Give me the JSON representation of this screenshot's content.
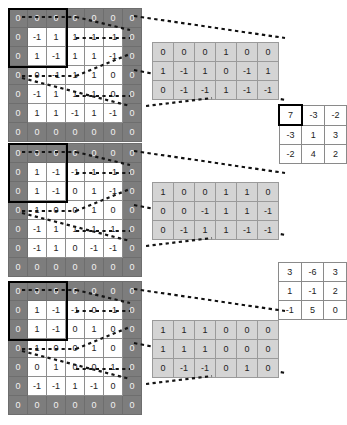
{
  "figure": {
    "colors": {
      "padding_cell": "#7d7d7d",
      "value_cell": "#ffffff",
      "small_matrix_cell": "#d4d4d4",
      "highlight_border": "#000000",
      "grid_line": "#8e8e8e"
    }
  },
  "blocks": [
    {
      "name": "block-1",
      "input_matrix": {
        "label": "padded-input-1",
        "rows": [
          [
            "0",
            "0",
            "0",
            "0",
            "0",
            "0",
            "0"
          ],
          [
            "0",
            "-1",
            "1",
            "1",
            "1",
            "-1",
            "0"
          ],
          [
            "0",
            "1",
            "-1",
            "1",
            "1",
            "-1",
            "0"
          ],
          [
            "0",
            "0",
            "-1",
            "1",
            "1",
            "0",
            "0"
          ],
          [
            "0",
            "-1",
            "1",
            "1",
            "1",
            "0",
            "0"
          ],
          [
            "0",
            "1",
            "1",
            "-1",
            "1",
            "-1",
            "0"
          ],
          [
            "0",
            "0",
            "0",
            "0",
            "0",
            "0",
            "0"
          ]
        ],
        "padding_mask": [
          [
            1,
            1,
            1,
            1,
            1,
            1,
            1
          ],
          [
            1,
            0,
            0,
            0,
            0,
            0,
            1
          ],
          [
            1,
            0,
            0,
            0,
            0,
            0,
            1
          ],
          [
            1,
            0,
            0,
            0,
            0,
            0,
            1
          ],
          [
            1,
            0,
            0,
            0,
            0,
            0,
            1
          ],
          [
            1,
            0,
            0,
            0,
            0,
            0,
            1
          ],
          [
            1,
            1,
            1,
            1,
            1,
            1,
            1
          ]
        ],
        "highlight_region": {
          "row": 0,
          "col": 0,
          "size": 3
        }
      },
      "patch_matrix": {
        "label": "patch-1",
        "rows": [
          [
            "0",
            "0",
            "0"
          ],
          [
            "1",
            "-1",
            "1"
          ],
          [
            "0",
            "-1",
            "-1"
          ]
        ]
      },
      "kernel_matrix": {
        "label": "kernel-1",
        "rows": [
          [
            "1",
            "0",
            "0"
          ],
          [
            "0",
            "-1",
            "1"
          ],
          [
            "1",
            "-1",
            "-1"
          ]
        ]
      }
    },
    {
      "name": "block-2",
      "input_matrix": {
        "label": "padded-input-2",
        "rows": [
          [
            "0",
            "0",
            "0",
            "0",
            "0",
            "0",
            "0"
          ],
          [
            "0",
            "1",
            "-1",
            "-1",
            "1",
            "-1",
            "0"
          ],
          [
            "0",
            "1",
            "-1",
            "0",
            "1",
            "-1",
            "0"
          ],
          [
            "0",
            "1",
            "0",
            "0",
            "1",
            "0",
            "0"
          ],
          [
            "0",
            "-1",
            "1",
            "1",
            "1",
            "1",
            "0"
          ],
          [
            "0",
            "-1",
            "1",
            "0",
            "-1",
            "-1",
            "0"
          ],
          [
            "0",
            "0",
            "0",
            "0",
            "0",
            "0",
            "0"
          ]
        ],
        "padding_mask": [
          [
            1,
            1,
            1,
            1,
            1,
            1,
            1
          ],
          [
            1,
            0,
            0,
            0,
            0,
            0,
            1
          ],
          [
            1,
            0,
            0,
            0,
            0,
            0,
            1
          ],
          [
            1,
            0,
            0,
            0,
            0,
            0,
            1
          ],
          [
            1,
            0,
            0,
            0,
            0,
            0,
            1
          ],
          [
            1,
            0,
            0,
            0,
            0,
            0,
            1
          ],
          [
            1,
            1,
            1,
            1,
            1,
            1,
            1
          ]
        ],
        "highlight_region": {
          "row": 0,
          "col": 0,
          "size": 3
        }
      },
      "patch_matrix": {
        "label": "patch-2",
        "rows": [
          [
            "1",
            "0",
            "0"
          ],
          [
            "0",
            "0",
            "-1"
          ],
          [
            "0",
            "-1",
            "1"
          ]
        ]
      },
      "kernel_matrix": {
        "label": "kernel-2",
        "rows": [
          [
            "1",
            "1",
            "0"
          ],
          [
            "1",
            "1",
            "-1"
          ],
          [
            "1",
            "-1",
            "-1"
          ]
        ]
      }
    },
    {
      "name": "block-3",
      "input_matrix": {
        "label": "padded-input-3",
        "rows": [
          [
            "0",
            "0",
            "0",
            "0",
            "0",
            "0",
            "0"
          ],
          [
            "0",
            "1",
            "-1",
            "-1",
            "0",
            "-1",
            "0"
          ],
          [
            "0",
            "1",
            "-1",
            "0",
            "1",
            "0",
            "0"
          ],
          [
            "0",
            "1",
            "0",
            "0",
            "1",
            "0",
            "0"
          ],
          [
            "0",
            "0",
            "1",
            "0",
            "0",
            "1",
            "0"
          ],
          [
            "0",
            "-1",
            "-1",
            "1",
            "-1",
            "0",
            "0"
          ],
          [
            "0",
            "0",
            "0",
            "0",
            "0",
            "0",
            "0"
          ]
        ],
        "padding_mask": [
          [
            1,
            1,
            1,
            1,
            1,
            1,
            1
          ],
          [
            1,
            0,
            0,
            0,
            0,
            0,
            1
          ],
          [
            1,
            0,
            0,
            0,
            0,
            0,
            1
          ],
          [
            1,
            0,
            0,
            0,
            0,
            0,
            1
          ],
          [
            1,
            0,
            0,
            0,
            0,
            0,
            1
          ],
          [
            1,
            0,
            0,
            0,
            0,
            0,
            1
          ],
          [
            1,
            1,
            1,
            1,
            1,
            1,
            1
          ]
        ],
        "highlight_region": {
          "row": 0,
          "col": 0,
          "size": 3
        }
      },
      "patch_matrix": {
        "label": "patch-3",
        "rows": [
          [
            "1",
            "1",
            "1"
          ],
          [
            "1",
            "1",
            "1"
          ],
          [
            "0",
            "-1",
            "-1"
          ]
        ]
      },
      "kernel_matrix": {
        "label": "kernel-3",
        "rows": [
          [
            "0",
            "0",
            "0"
          ],
          [
            "0",
            "0",
            "0"
          ],
          [
            "0",
            "1",
            "0"
          ]
        ]
      }
    }
  ],
  "results": [
    {
      "name": "result-1",
      "rows": [
        [
          "7",
          "-3",
          "-2"
        ],
        [
          "-3",
          "1",
          "3"
        ],
        [
          "-2",
          "4",
          "2"
        ]
      ],
      "highlight_cell": {
        "row": 0,
        "col": 0
      }
    },
    {
      "name": "result-2",
      "rows": [
        [
          "3",
          "-6",
          "3"
        ],
        [
          "1",
          "-1",
          "2"
        ],
        [
          "-1",
          "5",
          "0"
        ]
      ],
      "highlight_cell": null
    }
  ]
}
